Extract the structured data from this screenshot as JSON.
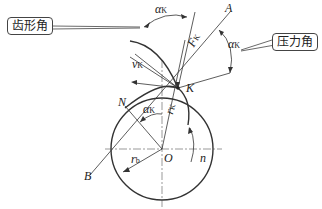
{
  "callouts": {
    "tooth_profile_angle": "齿形角",
    "pressure_angle": "压力角"
  },
  "labels": {
    "A": "A",
    "B": "B",
    "K": "K",
    "N": "N",
    "O": "O",
    "n": "n",
    "alpha": "α",
    "alpha_sub": "K",
    "F": "F",
    "F_sub": "K",
    "v": "v",
    "v_sub": "K",
    "r": "r",
    "r_sub": "K",
    "rb": "r",
    "rb_sub": "b"
  },
  "colors": {
    "line": "#333333",
    "text": "#222222"
  }
}
